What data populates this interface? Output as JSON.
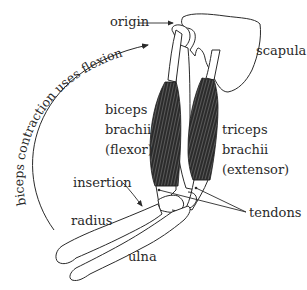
{
  "diagram": {
    "type": "anatomical-illustration",
    "labels": {
      "origin": "origin",
      "scapula": "scapula",
      "biceps": [
        "biceps",
        "brachii",
        "(flexor)"
      ],
      "triceps": [
        "triceps",
        "brachii",
        "(extensor)"
      ],
      "insertion": "insertion",
      "radius": "radius",
      "ulna": "ulna",
      "tendons": "tendons",
      "arc": "biceps contraction uses flexion"
    },
    "colors": {
      "line": "#2a2a2a",
      "muscle": "#2b2b2b",
      "muscle_stripe": "#6a6a6a",
      "bone_fill": "#ffffff",
      "background": "#ffffff"
    }
  }
}
